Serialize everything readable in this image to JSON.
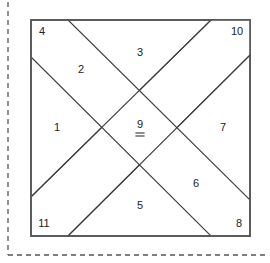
{
  "figure": {
    "background_color": "#ffffff",
    "outline_color": "#555555",
    "edge_color": "#3b3b3b",
    "label_color": "#222222"
  },
  "crop_guide": {
    "name": "dashed-crop-marks",
    "style": "dashed",
    "color": "#555555",
    "vertical_x": 8,
    "horizontal_y": 255
  },
  "square": {
    "left": 31,
    "top": 20,
    "right": 250,
    "bottom": 236
  },
  "regions": [
    {
      "id": "1",
      "label": "1",
      "shape": "triangle",
      "cx": 57,
      "cy": 128,
      "underline": false
    },
    {
      "id": "2",
      "label": "2",
      "shape": "band-cell",
      "cx": 81,
      "cy": 70,
      "underline": false
    },
    {
      "id": "3",
      "label": "3",
      "shape": "triangle",
      "cx": 140,
      "cy": 53,
      "underline": false
    },
    {
      "id": "4",
      "label": "4",
      "shape": "triangle",
      "cx": 42,
      "cy": 32,
      "underline": false
    },
    {
      "id": "5",
      "label": "5",
      "shape": "triangle",
      "cx": 140,
      "cy": 206,
      "underline": false
    },
    {
      "id": "6",
      "label": "6",
      "shape": "band-cell",
      "cx": 196,
      "cy": 184,
      "underline": false
    },
    {
      "id": "7",
      "label": "7",
      "shape": "triangle",
      "cx": 223,
      "cy": 128,
      "underline": false
    },
    {
      "id": "8",
      "label": "8",
      "shape": "triangle",
      "cx": 239,
      "cy": 224,
      "underline": false
    },
    {
      "id": "9",
      "label": "9",
      "shape": "band-cross",
      "cx": 140,
      "cy": 127,
      "underline": true
    },
    {
      "id": "10",
      "label": "10",
      "shape": "triangle",
      "cx": 237,
      "cy": 32,
      "underline": false
    },
    {
      "id": "11",
      "label": "11",
      "shape": "triangle",
      "cx": 44,
      "cy": 224,
      "underline": false
    }
  ],
  "geometry": {
    "band_a_note": "Band running lower-left to upper-right",
    "band_b_note": "Band running upper-left to lower-right",
    "band_a": {
      "top_edge": [
        [
          32,
          58
        ],
        [
          68,
          20
        ],
        [
          211,
          20
        ],
        [
          250,
          55
        ]
      ],
      "bottom_edge": [
        [
          32,
          196
        ],
        [
          68,
          236
        ],
        [
          211,
          236
        ],
        [
          250,
          200
        ]
      ]
    },
    "vertices": {
      "left_upper": [
        32,
        58
      ],
      "left_lower": [
        32,
        196
      ],
      "top_left_peak": [
        68,
        20
      ],
      "top_right_peak": [
        211,
        20
      ],
      "right_upper": [
        250,
        55
      ],
      "right_lower": [
        250,
        200
      ],
      "bottom_left_valley": [
        68,
        236
      ],
      "bottom_right_valley": [
        211,
        236
      ]
    }
  }
}
